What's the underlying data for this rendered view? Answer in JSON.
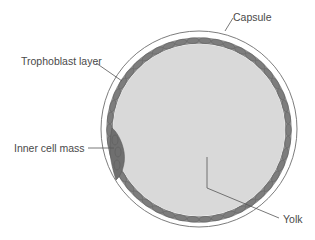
{
  "figure": {
    "type": "labeled anatomical diagram",
    "labels": {
      "capsule": "Capsule",
      "trophoblast_layer": "Trophoblast layer",
      "inner_cell_mass": "Inner cell mass",
      "yolk": "Yolk"
    },
    "colors": {
      "background": "#ffffff",
      "capsule_stroke": "#6e6e6e",
      "trophoblast_band": "#8c8c8c",
      "trophoblast_cells": "#7a7a7a",
      "cell_outline": "#5e5e5e",
      "yolk_fill": "#d9d9d9",
      "inner_cell_mass": "#6f6f6f",
      "leader_line": "#555555",
      "label_text": "#4a4a4a"
    }
  }
}
